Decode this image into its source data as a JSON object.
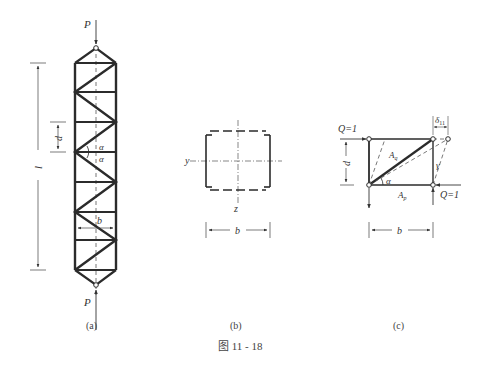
{
  "figure": {
    "caption": "图 11 - 18",
    "panels": [
      {
        "id": "a",
        "label": "(a)",
        "symbols": {
          "load_top": "P",
          "load_bottom": "P",
          "length": "l",
          "panel_height": "d",
          "width": "b",
          "angle_upper": "α",
          "angle_lower": "α"
        }
      },
      {
        "id": "b",
        "label": "(b)",
        "symbols": {
          "axis_y": "y",
          "axis_z": "z",
          "width": "b"
        }
      },
      {
        "id": "c",
        "label": "(c)",
        "symbols": {
          "force_top": "Q=1",
          "force_bottom": "Q=1",
          "displacement": "δ11",
          "displacement_sub": "11",
          "height": "d",
          "width": "b",
          "angle": "α",
          "shear_angle": "γ",
          "diag_area": "A",
          "diag_area_sub": "q",
          "post_area": "A",
          "post_area_sub": "p"
        }
      }
    ]
  },
  "colors": {
    "line": "#2b2b2b",
    "thin": "#555555",
    "text": "#333333"
  }
}
